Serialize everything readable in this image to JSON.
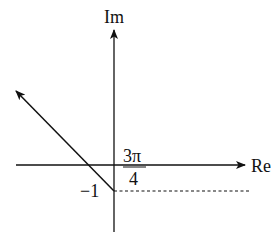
{
  "diagram": {
    "axes": {
      "imag_label": "Im",
      "real_label": "Re"
    },
    "point": {
      "label": "−1",
      "value": -1
    },
    "angle": {
      "numerator": "3π",
      "denominator": "4"
    },
    "colors": {
      "stroke": "#111111",
      "background": "#ffffff"
    }
  }
}
